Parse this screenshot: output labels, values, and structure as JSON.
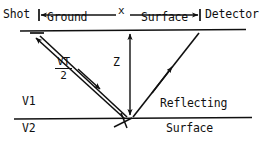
{
  "diagram": {
    "type": "seismic-reflection-raypath",
    "labels": {
      "shot": "Shot",
      "ground": "Ground",
      "offset": "x",
      "surface_top": "Surface",
      "detector": "Detector",
      "depth": "Z",
      "raypath_numerator": "VT",
      "raypath_denominator": "2",
      "velocity_upper": "V1",
      "velocity_lower": "V2",
      "reflecting": "Reflecting",
      "surface_bottom": "Surface"
    },
    "colors": {
      "ink": "#101010",
      "background": "#ffffff"
    }
  }
}
